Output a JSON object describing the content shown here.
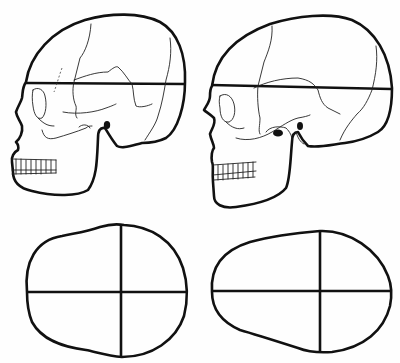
{
  "figure": {
    "panels": [
      {
        "id": "skull-left",
        "kind": "skull-lateral-view",
        "has_horizontal_length_line": true
      },
      {
        "id": "skull-right",
        "kind": "skull-lateral-view",
        "has_horizontal_length_line": true
      },
      {
        "id": "head-outline-left",
        "kind": "cranial-outline-top-view",
        "has_cross_axes": true
      },
      {
        "id": "head-outline-right",
        "kind": "cranial-outline-top-view",
        "has_cross_axes": true
      }
    ],
    "colors": {
      "ink": "#111111",
      "paper": "#fefefe"
    }
  }
}
